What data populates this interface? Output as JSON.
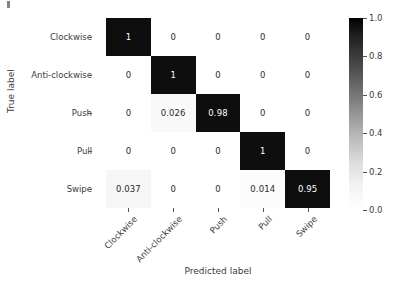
{
  "chart_data": {
    "type": "heatmap",
    "title": "",
    "xlabel": "Predicted label",
    "ylabel": "True label",
    "categories": [
      "Clockwise",
      "Anti-clockwise",
      "Push",
      "Pull",
      "Swipe"
    ],
    "x_categories": [
      "Clockwise",
      "Anti-clockwise",
      "Push",
      "Pull",
      "Swipe"
    ],
    "y_categories": [
      "Clockwise",
      "Anti-clockwise",
      "Push",
      "Pull",
      "Swipe"
    ],
    "matrix": [
      [
        1,
        0,
        0,
        0,
        0
      ],
      [
        0,
        1,
        0,
        0,
        0
      ],
      [
        0,
        0.026,
        0.98,
        0,
        0
      ],
      [
        0,
        0,
        0,
        1,
        0
      ],
      [
        0.037,
        0,
        0,
        0.014,
        0.95
      ]
    ],
    "cell_labels": [
      [
        "1",
        "0",
        "0",
        "0",
        "0"
      ],
      [
        "0",
        "1",
        "0",
        "0",
        "0"
      ],
      [
        "0",
        "0.026",
        "0.98",
        "0",
        "0"
      ],
      [
        "0",
        "0",
        "0",
        "1",
        "0"
      ],
      [
        "0.037",
        "0",
        "0",
        "0.014",
        "0.95"
      ]
    ],
    "colormap": "Greys",
    "colorbar": {
      "ticks": [
        "1.0",
        "0.8",
        "0.6",
        "0.4",
        "0.2",
        "0.0"
      ],
      "tick_values": [
        1.0,
        0.8,
        0.6,
        0.4,
        0.2,
        0.0
      ],
      "vmin": 0.0,
      "vmax": 1.0,
      "position": "right"
    },
    "grid": false,
    "xtick_rotation": -45
  },
  "colors": {
    "background": "#ffffff",
    "text": "#3b3b3b",
    "cell_dark": "#0e0e0e",
    "cell_dark_text": "#ffffff",
    "cell_light_text": "#2b2b2b",
    "tick": "#555555"
  }
}
